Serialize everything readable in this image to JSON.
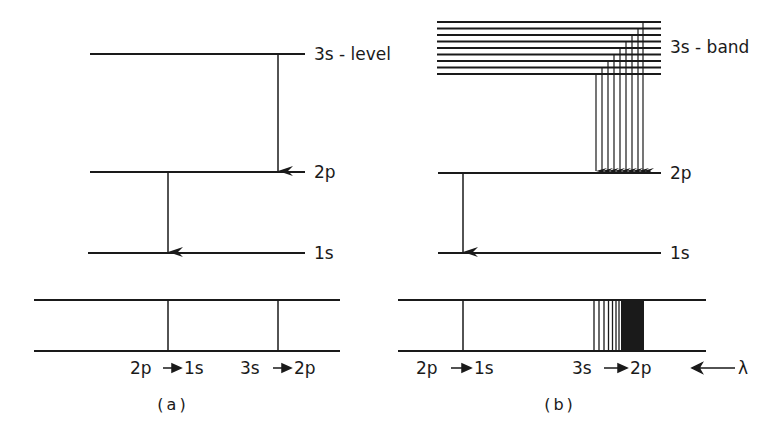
{
  "panel_a": {
    "caption": "(a)",
    "levels": {
      "s3": {
        "label": "3s - level"
      },
      "p2": {
        "label": "2p"
      },
      "s1": {
        "label": "1s"
      }
    },
    "spectrum_labels": {
      "t1_from": "2p",
      "t1_to": "1s",
      "t2_from": "3s",
      "t2_to": "2p"
    }
  },
  "panel_b": {
    "caption": "(b)",
    "levels": {
      "s3": {
        "label": "3s - band"
      },
      "p2": {
        "label": "2p"
      },
      "s1": {
        "label": "1s"
      }
    },
    "band_line_count": 9,
    "spectrum_labels": {
      "t1_from": "2p",
      "t1_to": "1s",
      "t2_from": "3s",
      "t2_to": "2p",
      "wavelength": "λ"
    }
  },
  "colors": {
    "ink": "#1a1a1a",
    "background": "#ffffff"
  }
}
